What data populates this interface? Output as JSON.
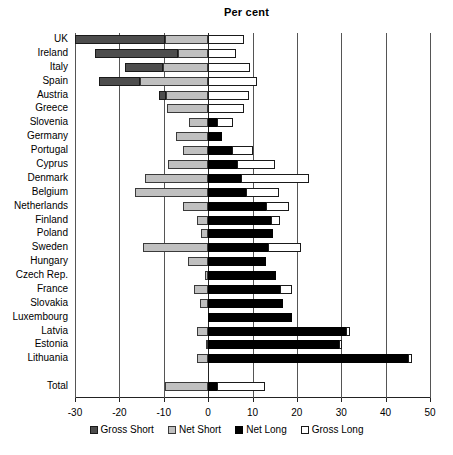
{
  "chart_data": {
    "type": "bar",
    "orientation": "horizontal",
    "title": "Per cent",
    "xlabel": "",
    "ylabel": "",
    "xlim": [
      -30,
      50
    ],
    "xticks": [
      -30,
      -20,
      -10,
      0,
      10,
      20,
      30,
      40,
      50
    ],
    "xtick_labels": [
      "-30",
      "-20",
      "-10",
      "0",
      "10",
      "20",
      "30",
      "40",
      "50"
    ],
    "grid": true,
    "grid_axis": "x",
    "legend_position": "bottom",
    "series": [
      {
        "name": "Gross Short",
        "color": "#4d4d4d"
      },
      {
        "name": "Net Short",
        "color": "#c0c0c0"
      },
      {
        "name": "Net Long",
        "color": "#000000"
      },
      {
        "name": "Gross Long",
        "color": "#ffffff"
      }
    ],
    "categories": [
      "UK",
      "Ireland",
      "Italy",
      "Spain",
      "Austria",
      "Greece",
      "Slovenia",
      "Germany",
      "Portugal",
      "Cyprus",
      "Denmark",
      "Belgium",
      "Netherlands",
      "Finland",
      "Poland",
      "Sweden",
      "Hungary",
      "Czech Rep.",
      "France",
      "Slovakia",
      "Luxembourg",
      "Latvia",
      "Estonia",
      "Lithuania",
      "Total"
    ],
    "rows": [
      {
        "category": "UK",
        "gross_short": -30.0,
        "net_short": -9.8,
        "net_long": 0.0,
        "gross_long": 8.0,
        "spacer": false
      },
      {
        "category": "Ireland",
        "gross_short": -25.6,
        "net_short": -6.8,
        "net_long": 0.0,
        "gross_long": 6.3,
        "spacer": false
      },
      {
        "category": "Italy",
        "gross_short": -18.8,
        "net_short": -10.2,
        "net_long": 0.0,
        "gross_long": 9.4,
        "spacer": false
      },
      {
        "category": "Spain",
        "gross_short": -24.6,
        "net_short": -15.4,
        "net_long": 0.0,
        "gross_long": 11.0,
        "spacer": false
      },
      {
        "category": "Austria",
        "gross_short": -11.0,
        "net_short": -9.5,
        "net_long": 0.0,
        "gross_long": 9.3,
        "spacer": false
      },
      {
        "category": "Greece",
        "gross_short": -9.2,
        "net_short": -9.2,
        "net_long": 0.0,
        "gross_long": 8.0,
        "spacer": false
      },
      {
        "category": "Slovenia",
        "gross_short": -4.4,
        "net_short": -4.4,
        "net_long": 2.0,
        "gross_long": 5.6,
        "spacer": false
      },
      {
        "category": "Germany",
        "gross_short": -7.3,
        "net_short": -7.3,
        "net_long": 3.2,
        "gross_long": 3.2,
        "spacer": false
      },
      {
        "category": "Portugal",
        "gross_short": -5.6,
        "net_short": -5.6,
        "net_long": 5.4,
        "gross_long": 10.2,
        "spacer": false
      },
      {
        "category": "Cyprus",
        "gross_short": -9.0,
        "net_short": -9.0,
        "net_long": 6.5,
        "gross_long": 15.0,
        "spacer": false
      },
      {
        "category": "Denmark",
        "gross_short": -14.3,
        "net_short": -14.3,
        "net_long": 7.3,
        "gross_long": 22.7,
        "spacer": false
      },
      {
        "category": "Belgium",
        "gross_short": -16.5,
        "net_short": -16.5,
        "net_long": 8.5,
        "gross_long": 16.0,
        "spacer": false
      },
      {
        "category": "Netherlands",
        "gross_short": -5.6,
        "net_short": -5.6,
        "net_long": 13.0,
        "gross_long": 18.3,
        "spacer": false
      },
      {
        "category": "Finland",
        "gross_short": -2.4,
        "net_short": -2.4,
        "net_long": 14.2,
        "gross_long": 16.3,
        "spacer": false
      },
      {
        "category": "Poland",
        "gross_short": -1.6,
        "net_short": -1.6,
        "net_long": 14.6,
        "gross_long": 14.6,
        "spacer": false
      },
      {
        "category": "Sweden",
        "gross_short": -14.6,
        "net_short": -14.6,
        "net_long": 13.4,
        "gross_long": 21.0,
        "spacer": false
      },
      {
        "category": "Hungary",
        "gross_short": -4.6,
        "net_short": -4.6,
        "net_long": 13.0,
        "gross_long": 13.0,
        "spacer": false
      },
      {
        "category": "Czech Rep.",
        "gross_short": -0.6,
        "net_short": -0.6,
        "net_long": 15.4,
        "gross_long": 15.4,
        "spacer": false
      },
      {
        "category": "France",
        "gross_short": -3.2,
        "net_short": -3.2,
        "net_long": 16.3,
        "gross_long": 18.8,
        "spacer": false
      },
      {
        "category": "Slovakia",
        "gross_short": -1.8,
        "net_short": -1.8,
        "net_long": 16.8,
        "gross_long": 16.8,
        "spacer": false
      },
      {
        "category": "Luxembourg",
        "gross_short": 0.0,
        "net_short": 0.0,
        "net_long": 18.8,
        "gross_long": 18.8,
        "spacer": false
      },
      {
        "category": "Latvia",
        "gross_short": -2.6,
        "net_short": -2.6,
        "net_long": 31.0,
        "gross_long": 32.0,
        "spacer": false
      },
      {
        "category": "Estonia",
        "gross_short": -0.5,
        "net_short": -0.5,
        "net_long": 29.5,
        "gross_long": 30.2,
        "spacer": false
      },
      {
        "category": "Lithuania",
        "gross_short": -2.4,
        "net_short": -2.4,
        "net_long": 45.0,
        "gross_long": 46.0,
        "spacer": false
      },
      {
        "category": "",
        "gross_short": null,
        "net_short": null,
        "net_long": null,
        "gross_long": null,
        "spacer": true
      },
      {
        "category": "Total",
        "gross_short": -9.8,
        "net_short": -9.8,
        "net_long": 2.0,
        "gross_long": 12.8,
        "spacer": false
      }
    ]
  },
  "legend": {
    "items": [
      {
        "label": "Gross Short",
        "swatch": "gross-short"
      },
      {
        "label": "Net Short",
        "swatch": "net-short"
      },
      {
        "label": "Net Long",
        "swatch": "net-long"
      },
      {
        "label": "Gross Long",
        "swatch": "gross-long"
      }
    ]
  }
}
